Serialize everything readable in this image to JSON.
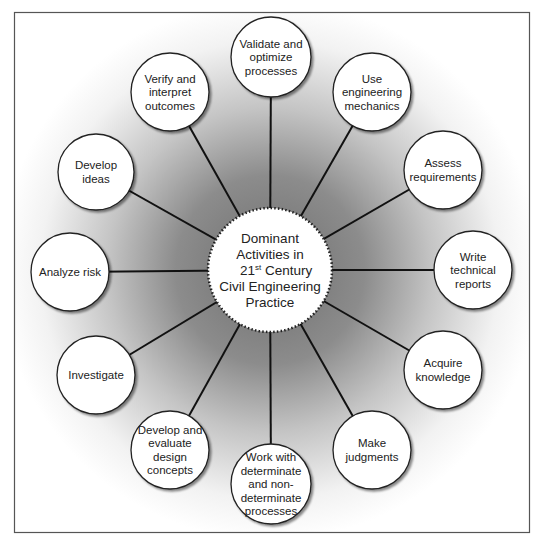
{
  "diagram": {
    "type": "radial-hub-and-spoke",
    "frame": {
      "x": 14,
      "y": 12,
      "width": 516,
      "height": 521,
      "border_color": "#555555"
    },
    "colors": {
      "background": "#ffffff",
      "halo_dark": "#7a7a7a",
      "node_fill": "#ffffff",
      "node_stroke": "#222222",
      "spoke": "#111111",
      "text": "#222222"
    },
    "hub": {
      "cx": 270,
      "cy": 270,
      "r": 62,
      "border_style": "dotted",
      "lines": [
        "Dominant",
        "Activities in",
        "21",
        "Civil Engineering",
        "Practice"
      ],
      "superscript": "st",
      "line3_suffix": " Century",
      "full_label": "Dominant Activities in 21st Century Civil Engineering Practice"
    },
    "nodes": [
      {
        "id": "validate",
        "cx": 271,
        "cy": 57,
        "r": 40,
        "lines": [
          "Validate and",
          "optimize",
          "processes"
        ]
      },
      {
        "id": "use-mechanics",
        "cx": 372,
        "cy": 92,
        "r": 39,
        "lines": [
          "Use",
          "engineering",
          "mechanics"
        ]
      },
      {
        "id": "assess",
        "cx": 443,
        "cy": 170,
        "r": 39,
        "lines": [
          "Assess",
          "requirements"
        ]
      },
      {
        "id": "write-reports",
        "cx": 473,
        "cy": 270,
        "r": 39,
        "lines": [
          "Write",
          "technical",
          "reports"
        ]
      },
      {
        "id": "acquire",
        "cx": 443,
        "cy": 370,
        "r": 39,
        "lines": [
          "Acquire",
          "knowledge"
        ]
      },
      {
        "id": "judgments",
        "cx": 372,
        "cy": 450,
        "r": 39,
        "lines": [
          "Make",
          "judgments"
        ]
      },
      {
        "id": "work-with",
        "cx": 271,
        "cy": 484,
        "r": 40,
        "lines": [
          "Work with",
          "determinate",
          "and non-",
          "determinate",
          "processes"
        ]
      },
      {
        "id": "develop-evaluate",
        "cx": 170,
        "cy": 450,
        "r": 39,
        "lines": [
          "Develop and",
          "evaluate",
          "design",
          "concepts"
        ]
      },
      {
        "id": "investigate",
        "cx": 96,
        "cy": 375,
        "r": 39,
        "lines": [
          "Investigate"
        ]
      },
      {
        "id": "analyze-risk",
        "cx": 70,
        "cy": 272,
        "r": 39,
        "lines": [
          "Analyze risk"
        ]
      },
      {
        "id": "develop-ideas",
        "cx": 96,
        "cy": 172,
        "r": 38,
        "lines": [
          "Develop",
          "ideas"
        ]
      },
      {
        "id": "verify",
        "cx": 170,
        "cy": 92,
        "r": 39,
        "lines": [
          "Verify and",
          "interpret",
          "outcomes"
        ]
      }
    ]
  }
}
